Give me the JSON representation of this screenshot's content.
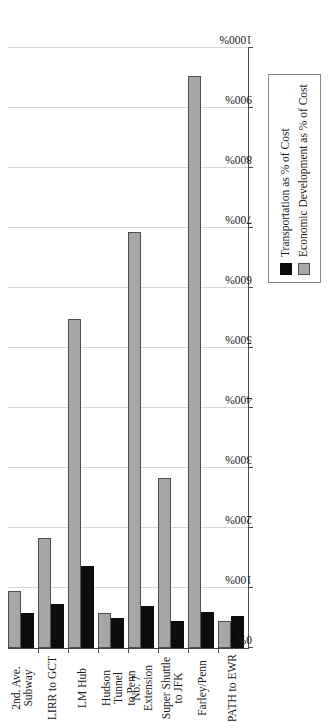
{
  "chart_data": {
    "type": "bar",
    "orientation": "horizontal",
    "title": "",
    "xlabel": "",
    "ylabel": "Benefits as % of Costs",
    "ylim": [
      0,
      1000
    ],
    "grid": true,
    "legend_position": "bottom-right",
    "tick_labels": [
      "0%",
      "100%",
      "200%",
      "300%",
      "400%",
      "500%",
      "600%",
      "700%",
      "800%",
      "900%",
      "1000%"
    ],
    "tick_values": [
      0,
      100,
      200,
      300,
      400,
      500,
      600,
      700,
      800,
      900,
      1000
    ],
    "categories": [
      "2nd. Ave. Subway",
      "LIRR to GCT",
      "LM Hub",
      "Hudson Tunnel to Penn",
      "No. 7 Extension",
      "Super Shuttle to JFK",
      "Farley/Penn",
      "PATH to EWR"
    ],
    "category_lines": [
      [
        "2nd. Ave.",
        "Subway"
      ],
      [
        "LIRR to GCT"
      ],
      [
        "LM Hub"
      ],
      [
        "Hudson Tunnel",
        "to Penn"
      ],
      [
        "No. 7",
        "Extension"
      ],
      [
        "Super Shuttle",
        "to JFK"
      ],
      [
        "Farley/Penn"
      ],
      [
        "PATH to EWR"
      ]
    ],
    "series": [
      {
        "name": "Transportation as % of Cost",
        "color": "#0d0d0d",
        "values": [
          55,
          70,
          133,
          46,
          67,
          42,
          57,
          50
        ]
      },
      {
        "name": "Economic Development as % of Cost",
        "color": "#a6a6a6",
        "values": [
          92,
          180,
          545,
          55,
          690,
          280,
          950,
          42
        ]
      }
    ]
  },
  "legend": {
    "items": [
      {
        "label": "Transportation as % of Cost",
        "swatch": "trans"
      },
      {
        "label": "Economic Development as % of Cost",
        "swatch": "econ"
      }
    ]
  }
}
